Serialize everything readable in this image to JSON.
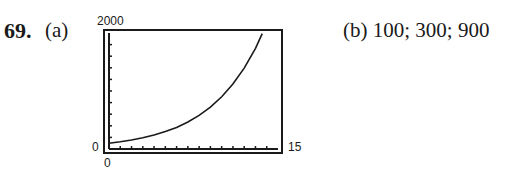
{
  "problem": {
    "number": "69.",
    "part_a_label": "(a)",
    "part_b_text": "(b) 100; 300; 900"
  },
  "graph_window": {
    "ymax_label": "2000",
    "ymin_label": "0",
    "xmin_label": "0",
    "xmax_label": "15"
  },
  "chart_data": {
    "type": "line",
    "title": "",
    "xlabel": "",
    "ylabel": "",
    "xlim": [
      0,
      15
    ],
    "ylim": [
      0,
      2000
    ],
    "x_tick_step": 1,
    "y_tick_step": 200,
    "grid": false,
    "series": [
      {
        "name": "y = 100·3^(t/5)",
        "x": [
          0,
          1,
          2,
          3,
          4,
          5,
          6,
          7,
          8,
          9,
          10,
          11,
          12,
          13,
          13.6
        ],
        "values": [
          100,
          125,
          155,
          193,
          241,
          300,
          373,
          465,
          579,
          721,
          900,
          1120,
          1394,
          1736,
          1990
        ]
      }
    ],
    "annotations": [
      "(b) 100; 300; 900"
    ]
  }
}
